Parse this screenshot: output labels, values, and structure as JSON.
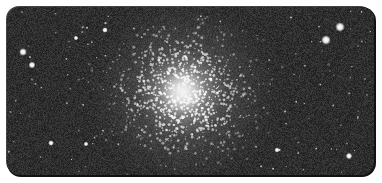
{
  "image": {
    "subject": "globular star cluster",
    "alt": "Black-and-white photograph of a dense globular star cluster against a dark sky",
    "frame": {
      "x": 7,
      "y": 7,
      "width": 367,
      "height": 168,
      "corner_radius": 13
    },
    "background_color": "#2e2e2e",
    "core_color": "#f2f2f2",
    "cluster_center": {
      "x": 183,
      "y": 92
    },
    "bright_stars": [
      {
        "x": 340,
        "y": 27,
        "r": 2.2
      },
      {
        "x": 326,
        "y": 40,
        "r": 2.2
      },
      {
        "x": 23,
        "y": 52,
        "r": 1.8
      },
      {
        "x": 32,
        "y": 65,
        "r": 1.6
      },
      {
        "x": 105,
        "y": 30,
        "r": 1.3
      },
      {
        "x": 76,
        "y": 38,
        "r": 1.1
      },
      {
        "x": 51,
        "y": 143,
        "r": 1.3
      },
      {
        "x": 349,
        "y": 156,
        "r": 1.5
      },
      {
        "x": 277,
        "y": 150,
        "r": 1.2
      },
      {
        "x": 86,
        "y": 144,
        "r": 1.1
      }
    ]
  }
}
